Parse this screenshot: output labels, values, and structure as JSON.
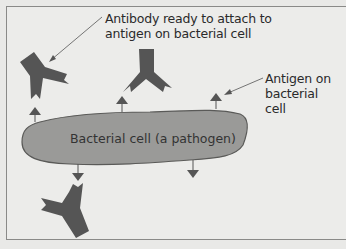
{
  "diagram": {
    "labels": {
      "antibody_callout": [
        "Antibody ready to attach to",
        "antigen on bacterial cell"
      ],
      "antigen_callout": [
        "Antigen on",
        "bacterial cell"
      ],
      "cell": "Bacterial cell (a pathogen)"
    },
    "colors": {
      "antibody": "#555555",
      "cell_fill": "#9a9a98",
      "cell_stroke": "#5a5a58",
      "antigen": "#555555",
      "background": "#ececea",
      "text": "#2a2a2a"
    },
    "elements": {
      "antibodies": 3,
      "antigens_top": 3,
      "antigens_bottom": 2
    }
  }
}
